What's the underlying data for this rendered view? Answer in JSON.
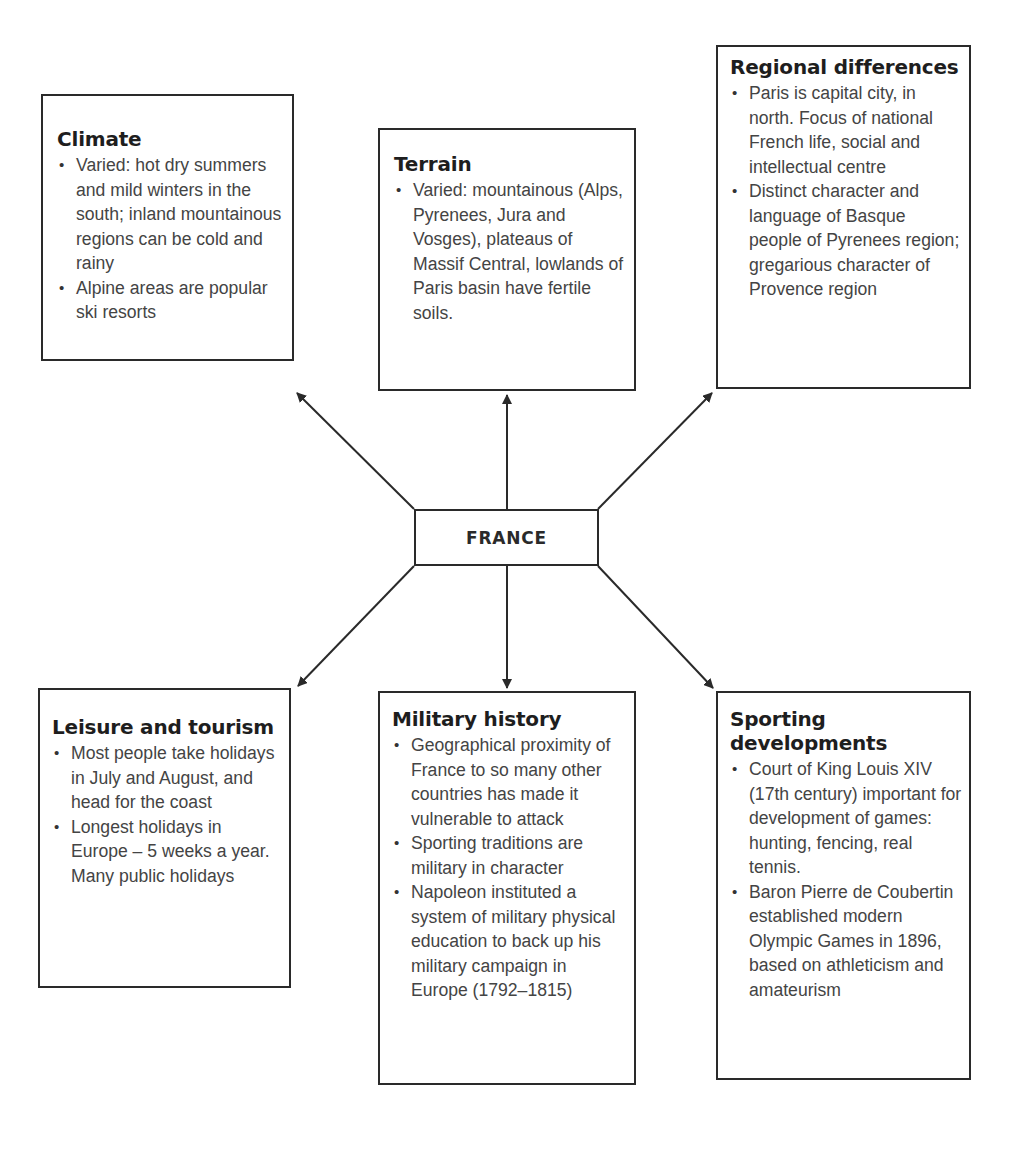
{
  "center": {
    "label": "FRANCE"
  },
  "boxes": {
    "climate": {
      "title": "Climate",
      "bullets": [
        "Varied: hot dry summers and mild winters in the south; inland mountainous regions can be cold and rainy",
        "Alpine areas are popular ski resorts"
      ]
    },
    "terrain": {
      "title": "Terrain",
      "bullets": [
        "Varied: mountainous (Alps, Pyrenees, Jura and Vosges), plateaus of Massif Central, lowlands of Paris basin have fertile soils."
      ]
    },
    "regional": {
      "title": "Regional differences",
      "bullets": [
        "Paris is capital city, in north. Focus of national French life, social and intellectual centre",
        "Distinct character and language of Basque people of Pyrenees region; gregarious character of Provence region"
      ]
    },
    "leisure": {
      "title": "Leisure and tourism",
      "bullets": [
        "Most people take holidays in July and August, and head for the coast",
        "Longest holidays in Europe – 5 weeks a year.  Many public holidays"
      ]
    },
    "military": {
      "title": "Military history",
      "bullets": [
        "Geographical proximity of France to so many other countries has made it vulnerable to attack",
        "Sporting traditions are military in character",
        "Napoleon instituted a system of military physical education to back up his military campaign in Europe (1792–1815)"
      ]
    },
    "sporting": {
      "title": "Sporting developments",
      "bullets": [
        "Court of King Louis XIV (17th century) important for development of games: hunting, fencing, real tennis.",
        "Baron Pierre de Coubertin established modern Olympic Games in 1896, based on athleticism and amateurism"
      ]
    }
  },
  "connections": [
    {
      "from": "center",
      "to": "climate"
    },
    {
      "from": "center",
      "to": "terrain"
    },
    {
      "from": "center",
      "to": "regional"
    },
    {
      "from": "center",
      "to": "leisure"
    },
    {
      "from": "center",
      "to": "military"
    },
    {
      "from": "center",
      "to": "sporting"
    }
  ],
  "colors": {
    "line": "#2a2a2a",
    "title": "#1e1e1e",
    "body": "#444444",
    "background": "#ffffff"
  }
}
